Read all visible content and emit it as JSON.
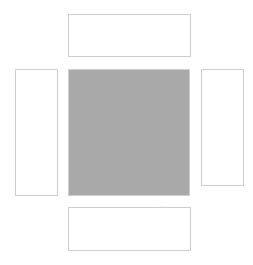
{
  "diagram": {
    "type": "tessellation-unfolded",
    "colors": {
      "background": "#ffffff",
      "filled": "#a9a9a9",
      "light_filled": "#e9e9e9",
      "edge": "#d4d4d4",
      "frame": "#cfcfcf",
      "vertex_marker": "#222222"
    },
    "panels": [
      {
        "id": "top",
        "x": 68,
        "y": 14,
        "w": 122,
        "h": 42
      },
      {
        "id": "left",
        "x": 15,
        "y": 69,
        "w": 42,
        "h": 126
      },
      {
        "id": "center",
        "x": 68,
        "y": 69,
        "w": 121,
        "h": 126
      },
      {
        "id": "right",
        "x": 201,
        "y": 69,
        "w": 42,
        "h": 116
      },
      {
        "id": "bottom",
        "x": 68,
        "y": 207,
        "w": 122,
        "h": 43
      }
    ],
    "top_filled": [
      "82,32 116,36 132,15 146,15 147,26 139,38 150,45 172,40 178,44 183,56 112,56 105,50 92,52 88,56 82,56",
      "142,26 160,30 162,37 150,41 145,38"
    ],
    "top_light": [
      "142,16 158,19 160,30 146,33",
      "164,38 174,35 177,44 165,44"
    ],
    "top_white": [
      "114,52 126,49 129,55 113,56"
    ],
    "top_edges": [
      "68,30 82,32",
      "76,14 82,32",
      "82,32 78,45 82,56",
      "97,14 100,30",
      "100,30 116,36",
      "116,36 112,56",
      "132,15 130,46",
      "139,38 130,46 126,49",
      "160,30 166,14",
      "160,30 170,33 186,30",
      "174,35 172,40",
      "95,42 92,52",
      "105,50 110,42 122,40",
      "78,45 68,47",
      "150,45 152,56",
      "170,33 176,14"
    ],
    "center_white": [
      "113,70 126,70 127,79 118,84",
      "101,84 112,80 115,89 104,93",
      "118,88 131,90 129,97 118,95",
      "100,101 108,99 111,110 101,111",
      "104,115 114,114 113,126 99,124",
      "92,130 101,131 102,141 90,142",
      "106,131 124,130 124,146 111,150",
      "138,117 153,104 166,109 160,119",
      "158,125 166,125 164,145 157,140",
      "172,120 178,108 180,115",
      "103,162 106,162 106,170 103,170",
      "152,152 156,152 160,172 151,169",
      "131,182 145,177 148,189 137,190",
      "150,186 158,181 164,192 152,193"
    ],
    "center_edges": [
      "68,92 80,84 100,86",
      "80,84 84,70",
      "100,86 104,95",
      "127,79 145,72",
      "145,72 160,80 172,78 188,82",
      "160,80 158,96",
      "130,92 140,100 156,96",
      "68,108 84,104 100,112",
      "84,104 90,120 80,132 68,134",
      "100,112 92,130",
      "124,100 132,112 126,130",
      "132,112 146,118 152,130",
      "156,96 172,100 188,96",
      "172,100 170,120",
      "68,150 86,150 96,166 84,178 68,182",
      "86,150 92,142",
      "110,150 108,170 96,166",
      "110,150 130,150 140,166",
      "130,150 128,130",
      "140,166 128,178 108,170",
      "140,166 156,160",
      "164,145 180,150 188,146",
      "180,150 178,170 188,178",
      "178,170 160,172",
      "128,178 126,194",
      "96,166 92,194",
      "170,120 188,124",
      "152,130 158,125",
      "106,88 104,95 90,96 84,104"
    ],
    "center_vertex_markers": [
      {
        "x": 115,
        "y": 86
      },
      {
        "x": 161,
        "y": 123
      },
      {
        "x": 102,
        "y": 132
      },
      {
        "x": 152,
        "y": 182
      }
    ],
    "center_edge_ticks": [
      {
        "x": 70,
        "y": 108
      },
      {
        "x": 70,
        "y": 146
      },
      {
        "x": 187,
        "y": 80
      },
      {
        "x": 187,
        "y": 140
      },
      {
        "x": 187,
        "y": 152
      },
      {
        "x": 93,
        "y": 192
      },
      {
        "x": 174,
        "y": 192
      },
      {
        "x": 187,
        "y": 180
      }
    ],
    "left_filled": [
      "38,146 51,132 56,136 56,153"
    ],
    "left_edges": [
      "15,80 24,76 34,82 40,92 54,88",
      "34,82 30,72",
      "24,76 18,92 24,106 36,104 44,96 40,92",
      "44,96 56,98",
      "24,106 18,122 28,134 38,146",
      "36,104 44,118 56,116",
      "44,118 38,146",
      "28,134 15,140",
      "38,146 34,166 20,170",
      "34,166 44,178 56,176",
      "44,178 40,195",
      "20,170 24,195",
      "52,86 54,100",
      "50,100 56,100"
    ],
    "right_filled": [
      "203,84 232,102 203,126",
      "203,143 217,170 211,184 203,184"
    ],
    "right_light": [
      "217,172 243,176 243,184 212,184"
    ],
    "right_edges": [
      "208,76 216,72 226,82 236,84 243,92",
      "226,82 232,102",
      "232,102 243,104",
      "218,116 222,140 236,148 243,146",
      "218,116 232,102",
      "222,140 214,150",
      "236,148 238,170 243,172",
      "217,170 243,176",
      "232,102 240,122 243,120"
    ],
    "bottom_filled": [
      "95,209 168,209 170,213 184,216 188,240 172,236 158,248 147,249 138,230 126,226 114,222 100,218"
    ],
    "bottom_white": [
      "153,208 163,207 166,216 156,218"
    ],
    "bottom_edges": [
      "68,218 80,212 95,209",
      "80,212 84,230 78,250",
      "84,230 100,226 114,222",
      "100,226 104,240 98,250",
      "104,240 118,238 126,226",
      "118,238 124,250",
      "138,230 142,220 156,218",
      "142,220 148,236",
      "166,216 172,228 184,226",
      "172,228 168,240",
      "104,244 118,246",
      "158,248 160,236 168,232"
    ]
  }
}
